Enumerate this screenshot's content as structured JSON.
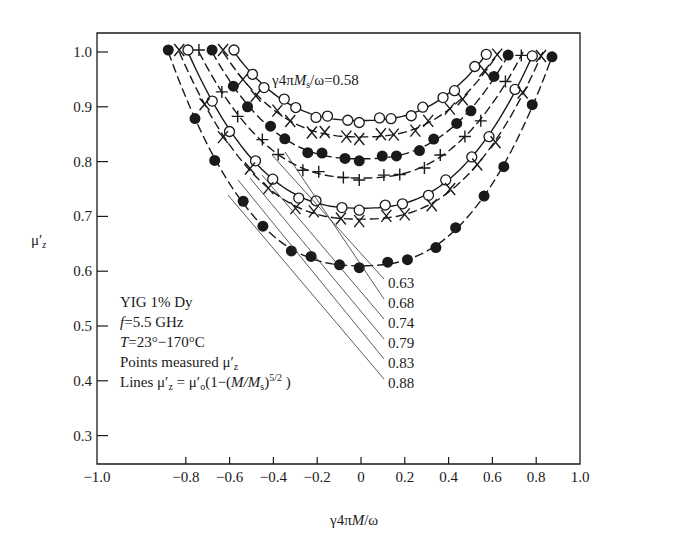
{
  "chart_data": {
    "type": "line",
    "title": "",
    "xlabel": "γ4πM/ω",
    "ylabel": "μ′z",
    "xlim": [
      -1.0,
      1.0
    ],
    "ylim": [
      0.25,
      1.03
    ],
    "grid": false,
    "x_ticks": [
      "−1.0",
      "−0.8",
      "−0.6",
      "−0.4",
      "−0.2",
      "0",
      "0.2",
      "0.4",
      "0.6",
      "0.8",
      "1.0"
    ],
    "y_ticks": [
      "0.3",
      "0.4",
      "0.5",
      "0.6",
      "0.7",
      "0.8",
      "0.9",
      "1.0"
    ],
    "series_label_prefix": "γ4πMs/ω=",
    "series": [
      {
        "name": "0.58",
        "marker": "open-circle",
        "line": "solid",
        "mu0": 0.875,
        "x_edge": 0.58
      },
      {
        "name": "0.63",
        "marker": "cross-x",
        "line": "dashed",
        "mu0": 0.845,
        "x_edge": 0.63
      },
      {
        "name": "0.68",
        "marker": "filled-circle",
        "line": "dashed",
        "mu0": 0.805,
        "x_edge": 0.68
      },
      {
        "name": "0.74",
        "marker": "plus",
        "line": "dashed",
        "mu0": 0.77,
        "x_edge": 0.74
      },
      {
        "name": "0.79",
        "marker": "open-circle",
        "line": "solid",
        "mu0": 0.715,
        "x_edge": 0.79
      },
      {
        "name": "0.83",
        "marker": "cross-x",
        "line": "dashed",
        "mu0": 0.695,
        "x_edge": 0.83
      },
      {
        "name": "0.88",
        "marker": "filled-circle",
        "line": "dashed",
        "mu0": 0.61,
        "x_edge": 0.88
      }
    ],
    "annotations": {
      "top_label": "γ4πMs/ω=0.58",
      "leader_labels": [
        "0.63",
        "0.68",
        "0.74",
        "0.79",
        "0.83",
        "0.88"
      ],
      "legend_lines": [
        "YIG 1% Dy",
        "f=5.5 GHz",
        "T=23°−170°C",
        "Points measured μ′z",
        "Lines μ′z = μ′o(1−(M/Ms)^(5/2))"
      ]
    }
  },
  "labels": {
    "xlabel_prefix": "γ4π",
    "xlabel_var": "M",
    "xlabel_suffix": "/ω",
    "ylabel_mu": "μ",
    "ylabel_prime": "′",
    "ylabel_sub": "z",
    "top_prefix": "γ4π",
    "top_var": "M",
    "top_sub": "s",
    "top_suffix": "/ω=0.58",
    "legend_1": "YIG 1% Dy",
    "legend_2_var": "f",
    "legend_2_rest": "=5.5 GHz",
    "legend_3_var": "T",
    "legend_3_rest": "=23°−170°C",
    "legend_4": "Points measured μ′",
    "legend_4_sub": "z",
    "legend_5_a": "Lines μ′",
    "legend_5_sub": "z",
    "legend_5_b": " = μ′",
    "legend_5_sub2": "o",
    "legend_5_c": "(1−(",
    "legend_5_var": "M/M",
    "legend_5_sub3": "s",
    "legend_5_d": ")",
    "legend_5_sup": "5/2",
    "legend_5_e": " )"
  }
}
